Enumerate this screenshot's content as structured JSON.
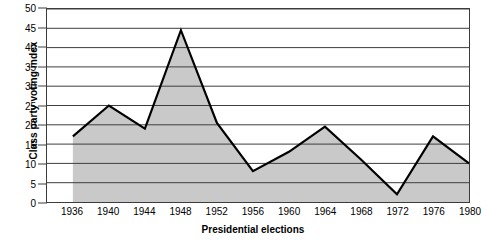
{
  "chart_data": {
    "type": "area",
    "title": "",
    "xlabel": "Presidential elections",
    "ylabel": "Class party voting index",
    "categories": [
      "1936",
      "1940",
      "1944",
      "1948",
      "1952",
      "1956",
      "1960",
      "1964",
      "1968",
      "1972",
      "1976",
      "1980"
    ],
    "values": [
      17,
      25,
      19,
      44.5,
      20.5,
      8,
      13,
      19.5,
      11,
      2,
      17,
      10
    ],
    "series": [
      {
        "name": "Class party voting index",
        "values": [
          17,
          25,
          19,
          44.5,
          20.5,
          8,
          13,
          19.5,
          11,
          2,
          17,
          10
        ]
      }
    ],
    "ylim": [
      0,
      50
    ],
    "yticks": [
      "0",
      "5",
      "10",
      "15",
      "20",
      "25",
      "30",
      "35",
      "40",
      "45",
      "50"
    ],
    "ytick_values": [
      0,
      5,
      10,
      15,
      20,
      25,
      30,
      35,
      40,
      45,
      50
    ],
    "grid": true,
    "grid_axis": "y",
    "legend": false,
    "legend_position": "none",
    "colors": {
      "fill": "#c9c9c9",
      "line": "#000000",
      "gridline": "#3c3c3c",
      "frame": "#3c3c3c",
      "text": "#000000",
      "background": "#ffffff"
    }
  }
}
